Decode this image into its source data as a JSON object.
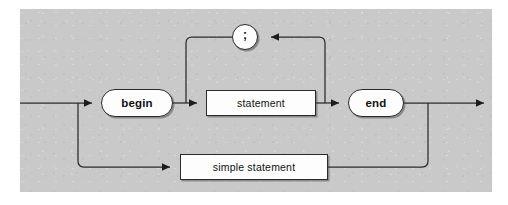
{
  "diagram": {
    "kind": "railroad-syntax-diagram",
    "title": "",
    "background_color": "#c9c9c9",
    "line_color": "#2b2b2b",
    "node_fill": "#fdfdfd",
    "nodes": [
      {
        "id": "begin",
        "label": "begin",
        "shape": "terminal",
        "bold": true
      },
      {
        "id": "statement",
        "label": "statement",
        "shape": "nonterminal",
        "bold": false
      },
      {
        "id": "end",
        "label": "end",
        "shape": "terminal",
        "bold": true
      },
      {
        "id": "semicolon",
        "label": ";",
        "shape": "terminal",
        "bold": true
      },
      {
        "id": "simple-statement",
        "label": "simple statement",
        "shape": "nonterminal",
        "bold": false
      }
    ],
    "paths": [
      {
        "id": "entry",
        "from": "start",
        "to": "begin"
      },
      {
        "id": "begin-stmt",
        "from": "begin",
        "to": "statement"
      },
      {
        "id": "stmt-end",
        "from": "statement",
        "to": "end"
      },
      {
        "id": "loop-back",
        "from": "statement",
        "to": "statement",
        "via": "semicolon",
        "direction": "right-to-left"
      },
      {
        "id": "end-exit",
        "from": "end",
        "to": "exit"
      },
      {
        "id": "bypass",
        "from": "start",
        "to": "exit",
        "via": "simple-statement"
      }
    ]
  }
}
